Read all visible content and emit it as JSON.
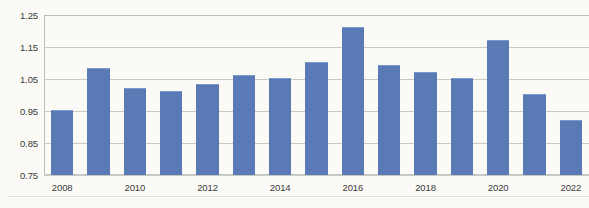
{
  "chart_data": {
    "type": "bar",
    "title": "",
    "subtitle": "",
    "xlabel": "",
    "ylabel": "",
    "categories": [
      "2008",
      "2009",
      "2010",
      "2011",
      "2012",
      "2013",
      "2014",
      "2015",
      "2016",
      "2017",
      "2018",
      "2019",
      "2020",
      "2021",
      "2022"
    ],
    "values": [
      0.95,
      1.08,
      1.02,
      1.01,
      1.03,
      1.06,
      1.05,
      1.1,
      1.21,
      1.09,
      1.07,
      1.05,
      1.17,
      1.0,
      0.92
    ],
    "series": [
      {
        "name": "Series 1",
        "values": [
          0.95,
          1.08,
          1.02,
          1.01,
          1.03,
          1.06,
          1.05,
          1.1,
          1.21,
          1.09,
          1.07,
          1.05,
          1.17,
          1.0,
          0.92
        ]
      }
    ],
    "ylim": [
      0.75,
      1.25
    ],
    "y_ticks": [
      "1.25",
      "1.15",
      "1.05",
      "0.95",
      "0.85",
      "0.75"
    ],
    "y_tick_values": [
      1.25,
      1.15,
      1.05,
      0.95,
      0.85,
      0.75
    ],
    "x_tick_labels": [
      "2008",
      "2010",
      "2012",
      "2014",
      "2016",
      "2018",
      "2020",
      "2022"
    ],
    "x_tick_categories": [
      "2008",
      "2010",
      "2012",
      "2014",
      "2016",
      "2018",
      "2020",
      "2022"
    ],
    "grid": "horizontal",
    "legend": "none",
    "bar_color": "#5a7ab5",
    "gridline_color": "#c9c9c4",
    "background_color": "#fbfaf7",
    "text_color": "#3a3a3a"
  }
}
